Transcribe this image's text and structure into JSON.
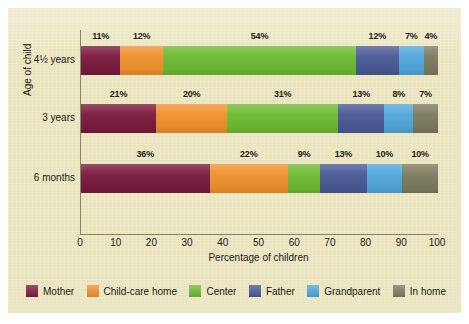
{
  "figure": {
    "background_color": "#e9e4bd",
    "axis_color": "#8a8466",
    "text_color": "#242017"
  },
  "chart_data": {
    "type": "bar",
    "orientation": "horizontal",
    "stacked": true,
    "title": "",
    "xlabel": "Percentage of children",
    "ylabel": "Age of child",
    "categories": [
      "4½ years",
      "3 years",
      "6 months"
    ],
    "xlim": [
      0,
      100
    ],
    "xticks": [
      0,
      10,
      20,
      30,
      40,
      50,
      60,
      70,
      80,
      90,
      100
    ],
    "xtick_labels": [
      "0",
      "10",
      "20",
      "30",
      "40",
      "50",
      "60",
      "70",
      "80",
      "90",
      "100"
    ],
    "grid": false,
    "legend_position": "bottom",
    "series": [
      {
        "name": "Mother",
        "color": "#7a1b3e",
        "values": [
          11,
          21,
          36
        ]
      },
      {
        "name": "Child-care home",
        "color": "#f0922f",
        "values": [
          12,
          20,
          22
        ]
      },
      {
        "name": "Center",
        "color": "#6fbb33",
        "values": [
          54,
          31,
          9
        ]
      },
      {
        "name": "Father",
        "color": "#4a5a96",
        "values": [
          12,
          13,
          13
        ]
      },
      {
        "name": "Grandparent",
        "color": "#52a8dd",
        "values": [
          7,
          8,
          10
        ]
      },
      {
        "name": "In home",
        "color": "#7d7b5e",
        "values": [
          4,
          7,
          10
        ]
      }
    ],
    "bar_labels": [
      [
        "11%",
        "12%",
        "54%",
        "12%",
        "7%",
        "4%"
      ],
      [
        "21%",
        "20%",
        "31%",
        "13%",
        "8%",
        "7%"
      ],
      [
        "36%",
        "22%",
        "9%",
        "13%",
        "10%",
        "10%"
      ]
    ]
  }
}
